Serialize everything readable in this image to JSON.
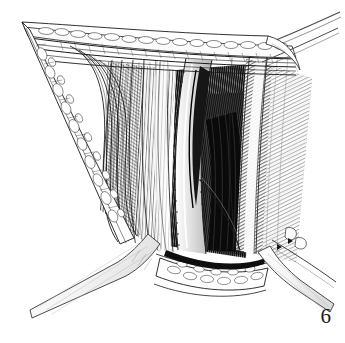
{
  "figure": {
    "number": "6",
    "caption": "",
    "medium": "pen-and-ink line engraving",
    "palette": {
      "background": "#ffffff",
      "ink": "#111111",
      "mid_tone": "#6b6b6b",
      "light_tone": "#b8b8b8",
      "pale_tone": "#d8d8d8",
      "deep_shadow": "#0a0a0a"
    },
    "canvas": {
      "width": 345,
      "height": 343
    }
  },
  "illustration": {
    "title": "Surgical exposure, figure 6",
    "regions": [
      {
        "id": "superior-skin-fat-band",
        "label": "Superior skin and subcutaneous fat band",
        "tone": "light",
        "description": "Curved band across the top of the field filled with rounded fat lobules"
      },
      {
        "id": "left-wound-edge",
        "label": "Left wound edge with subcutaneous fat",
        "tone": "light",
        "description": "Tapering wedge of everted skin edge descending from the upper-left apex, packed with oval fat globules"
      },
      {
        "id": "left-fascial-layers",
        "label": "Retracted fascial layers, left",
        "tone": "mid",
        "description": "Nested concentric contour lines of retracted fascia at the left of the wound"
      },
      {
        "id": "left-muscle-belly",
        "label": "Left muscle belly",
        "tone": "mid",
        "description": "Longitudinally striated muscle fibers filling the left half of the wound"
      },
      {
        "id": "central-neurovascular-bundle",
        "label": "Central neurovascular bundle",
        "tone": "light",
        "description": "Pale elongated vessel and nerve loop running vertically down the middle of the field with stippled margins"
      },
      {
        "id": "deep-tissue-plane",
        "label": "Deep tissue plane",
        "tone": "deep-shadow",
        "description": "Densely hatched dark recess at the depth of the wound"
      },
      {
        "id": "right-muscle-flap",
        "label": "Right retracted muscle flap",
        "tone": "mid",
        "description": "Broad diagonally hatched muscle flap retracted to the right"
      },
      {
        "id": "inferior-fat-band",
        "label": "Inferior subcutaneous fat band",
        "tone": "light",
        "description": "Lower wound margin with rounded fat lobules"
      }
    ],
    "instruments": [
      {
        "id": "retractor-blade-lower-left",
        "label": "Retractor blade, lower left",
        "type": "retractor-blade"
      },
      {
        "id": "retractor-blade-lower-right",
        "label": "Retractor blade, lower right",
        "type": "retractor-blade"
      },
      {
        "id": "retractor-arm-upper-right",
        "label": "Retractor arm, upper right",
        "type": "retractor-arm"
      },
      {
        "id": "retractor-arm-lower-right",
        "label": "Retractor arm, lower right",
        "type": "retractor-arm"
      }
    ]
  }
}
